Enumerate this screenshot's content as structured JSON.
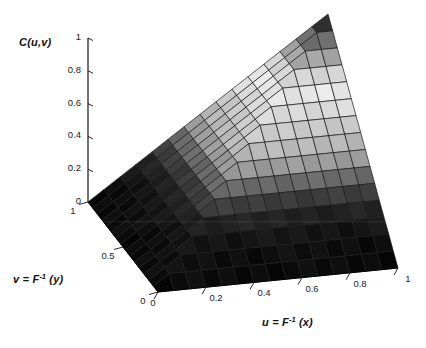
{
  "figure": {
    "background_color": "#ffffff",
    "mesh_line_color": "#1a1a1a",
    "axis_line_color": "#000000",
    "z_axis": {
      "title": "C(u,v)",
      "tick_labels": [
        "1",
        "0.8",
        "0.6",
        "0.4",
        "0.2",
        "0"
      ]
    },
    "v_axis": {
      "title_prefix": "v = F",
      "title_sup": "-1",
      "title_suffix": " (y)",
      "tick_labels": [
        "1",
        "0.5",
        "0"
      ]
    },
    "u_axis": {
      "title_prefix": "u = F",
      "title_sup": "-1",
      "title_suffix": " (x)",
      "tick_labels": [
        "0",
        "0.2",
        "0.4",
        "0.6",
        "0.8",
        "1"
      ]
    }
  },
  "chart_data": {
    "type": "3d-surface",
    "title": "",
    "zlabel": "C(u,v)",
    "xlabel": "u = F^-1 (x)",
    "ylabel": "v = F^-1 (y)",
    "surface_function": "C(u,v) = min(u, v) (Frechet-Hoeffding upper bound copula)",
    "surface_id": "min",
    "u_range": [
      0,
      1
    ],
    "v_range": [
      0,
      1
    ],
    "z_range": [
      0,
      1
    ],
    "grid_divisions": 15,
    "u_ticks": [
      0,
      0.2,
      0.4,
      0.6,
      0.8,
      1
    ],
    "v_ticks": [
      0,
      0.5,
      1
    ],
    "z_ticks": [
      0,
      0.2,
      0.4,
      0.6,
      0.8,
      1
    ],
    "legend": "none",
    "grid": "mesh surface with black facet edges",
    "colormap": "jet reproduced as print grayscale (dark at low C, brightest near C=0.7, dark red prints dark at C=1)",
    "gray_ramp_anchors": [
      [
        0,
        9
      ],
      [
        0.1,
        14
      ],
      [
        0.18,
        22
      ],
      [
        0.26,
        40
      ],
      [
        0.32,
        70
      ],
      [
        0.38,
        115
      ],
      [
        0.44,
        160
      ],
      [
        0.5,
        185
      ],
      [
        0.58,
        205
      ],
      [
        0.66,
        225
      ],
      [
        0.72,
        232
      ],
      [
        0.78,
        205
      ],
      [
        0.84,
        160
      ],
      [
        0.9,
        110
      ],
      [
        0.95,
        62
      ],
      [
        1,
        36
      ]
    ],
    "z_matrix_u0_to_1_step02_rows_v0_to_1": [
      [
        0,
        0,
        0,
        0,
        0,
        0
      ],
      [
        0,
        0.2,
        0.2,
        0.2,
        0.2,
        0.2
      ],
      [
        0,
        0.2,
        0.4,
        0.4,
        0.4,
        0.4
      ],
      [
        0,
        0.2,
        0.4,
        0.6,
        0.6,
        0.6
      ],
      [
        0,
        0.2,
        0.4,
        0.6,
        0.8,
        0.8
      ],
      [
        0,
        0.2,
        0.4,
        0.6,
        0.8,
        1
      ]
    ]
  }
}
